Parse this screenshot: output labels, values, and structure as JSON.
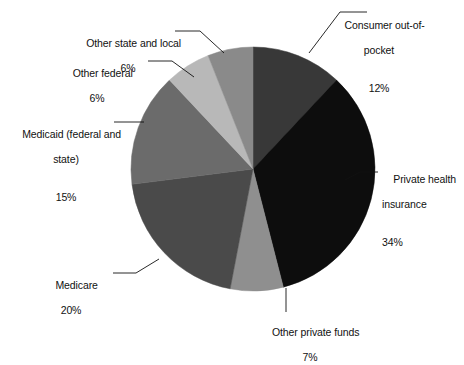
{
  "chart_data": {
    "type": "pie",
    "title": "",
    "subtitle": "",
    "xlabel": "",
    "ylabel": "",
    "legend_position": "none",
    "grid": false,
    "unit": "%",
    "start_angle_deg": 0,
    "direction": "clockwise",
    "categories": [
      "Consumer out-of-pocket",
      "Private health insurance",
      "Other private funds",
      "Medicare",
      "Medicaid (federal and state)",
      "Other federal",
      "Other state and local"
    ],
    "values": [
      12,
      34,
      7,
      20,
      15,
      6,
      6
    ],
    "colors": [
      "#383838",
      "#0d0d0d",
      "#8f8f8f",
      "#4a4a4a",
      "#6b6b6b",
      "#b8b8b8",
      "#8a8a8a"
    ],
    "slices": [
      {
        "id": "consumer-out-of-pocket",
        "label": "Consumer out-of-\npocket",
        "label_line1": "Consumer out-of-",
        "label_line2": "pocket",
        "value": 12,
        "value_text": "12%",
        "color": "#383838",
        "start_deg": 0,
        "end_deg": 43.2
      },
      {
        "id": "private-health-insurance",
        "label": "Private health\ninsurance",
        "label_line1": "Private health",
        "label_line2": "insurance",
        "value": 34,
        "value_text": "34%",
        "color": "#0d0d0d",
        "start_deg": 43.2,
        "end_deg": 165.6
      },
      {
        "id": "other-private-funds",
        "label": "Other private funds",
        "label_line1": "Other private funds",
        "label_line2": "",
        "value": 7,
        "value_text": "7%",
        "color": "#8f8f8f",
        "start_deg": 165.6,
        "end_deg": 190.8
      },
      {
        "id": "medicare",
        "label": "Medicare",
        "label_line1": "Medicare",
        "label_line2": "",
        "value": 20,
        "value_text": "20%",
        "color": "#4a4a4a",
        "start_deg": 190.8,
        "end_deg": 262.8
      },
      {
        "id": "medicaid",
        "label": "Medicaid (federal and\nstate)",
        "label_line1": "Medicaid (federal and",
        "label_line2": "state)",
        "value": 15,
        "value_text": "15%",
        "color": "#6b6b6b",
        "start_deg": 262.8,
        "end_deg": 316.8
      },
      {
        "id": "other-federal",
        "label": "Other federal",
        "label_line1": "Other federal",
        "label_line2": "",
        "value": 6,
        "value_text": "6%",
        "color": "#b8b8b8",
        "start_deg": 316.8,
        "end_deg": 338.4
      },
      {
        "id": "other-state-and-local",
        "label": "Other state and local",
        "label_line1": "Other state and local",
        "label_line2": "",
        "value": 6,
        "value_text": "6%",
        "color": "#8a8a8a",
        "start_deg": 338.4,
        "end_deg": 360
      }
    ]
  }
}
